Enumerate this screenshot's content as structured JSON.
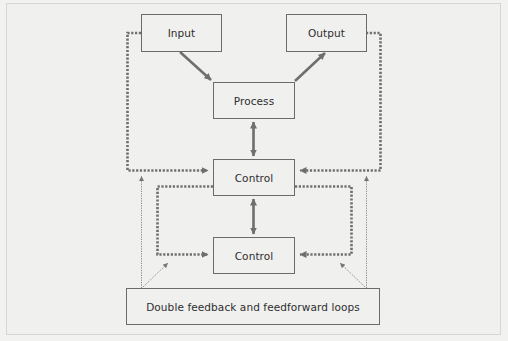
{
  "diagram": {
    "nodes": {
      "input": "Input",
      "output": "Output",
      "process": "Process",
      "control_upper": "Control",
      "control_lower": "Control",
      "footer": "Double feedback and feedforward loops"
    },
    "edges": [
      {
        "from": "Input",
        "to": "Process",
        "style": "solid-arrow"
      },
      {
        "from": "Process",
        "to": "Output",
        "style": "solid-arrow"
      },
      {
        "from": "Process",
        "to": "Control (upper)",
        "style": "solid-double-arrow"
      },
      {
        "from": "Control (upper)",
        "to": "Control (lower)",
        "style": "solid-double-arrow"
      },
      {
        "from": "Input",
        "to": "Control (upper)",
        "style": "dotted-loop-arrow"
      },
      {
        "from": "Output",
        "to": "Control (upper)",
        "style": "dotted-loop-arrow"
      },
      {
        "from": "Control (upper)",
        "to": "Control (lower)",
        "style": "dotted-loop-arrow-left"
      },
      {
        "from": "Control (upper)",
        "to": "Control (lower)",
        "style": "dotted-loop-arrow-right"
      },
      {
        "from": "Double feedback and feedforward loops",
        "to": "outer loops",
        "style": "fine-dotted-arrow"
      },
      {
        "from": "Double feedback and feedforward loops",
        "to": "inner loops",
        "style": "fine-dotted-arrow"
      }
    ],
    "colors": {
      "background": "#f2f2f1",
      "box_border": "#6b6b6b",
      "arrow": "#6f6f6f",
      "text": "#2e2e2e"
    }
  }
}
